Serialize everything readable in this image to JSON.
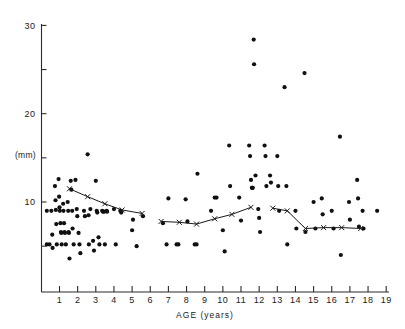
{
  "chart_data": {
    "type": "scatter",
    "title": "",
    "xlabel": "AGE (years)",
    "ylabel": "(mm)",
    "xlim": [
      0,
      19.4
    ],
    "ylim": [
      0,
      30.5
    ],
    "xticks": [
      1,
      2,
      3,
      4,
      5,
      6,
      7,
      8,
      9,
      10,
      11,
      12,
      13,
      14,
      15,
      16,
      17,
      18,
      19
    ],
    "xtick_labels": [
      "1",
      "2",
      "3",
      "4",
      "5",
      "6",
      "7",
      "8",
      "9",
      "10",
      "11",
      "12",
      "13",
      "14",
      "15",
      "16",
      "17",
      "18",
      "19"
    ],
    "yticks": [
      5,
      10,
      15,
      20,
      25,
      30
    ],
    "ytick_labels": [
      "",
      "10",
      "",
      "20",
      "",
      "30"
    ],
    "ytick_labeled": [
      10,
      20,
      30
    ],
    "grid": false,
    "legend": false,
    "series": [
      {
        "name": "individual measurements",
        "marker": "filled-circle",
        "color": "#101010",
        "points": [
          [
            0.3,
            9.0
          ],
          [
            0.3,
            5.2
          ],
          [
            0.45,
            5.2
          ],
          [
            0.55,
            9.0
          ],
          [
            0.6,
            6.3
          ],
          [
            0.62,
            4.8
          ],
          [
            0.75,
            11.8
          ],
          [
            0.78,
            10.2
          ],
          [
            0.8,
            9.1
          ],
          [
            0.82,
            7.5
          ],
          [
            0.85,
            5.2
          ],
          [
            0.95,
            12.6
          ],
          [
            0.98,
            10.6
          ],
          [
            1.0,
            9.4
          ],
          [
            1.02,
            9.0
          ],
          [
            1.05,
            7.6
          ],
          [
            1.08,
            6.6
          ],
          [
            1.1,
            6.5
          ],
          [
            1.12,
            5.2
          ],
          [
            1.2,
            9.8
          ],
          [
            1.22,
            9.0
          ],
          [
            1.25,
            7.6
          ],
          [
            1.28,
            6.6
          ],
          [
            1.3,
            6.5
          ],
          [
            1.35,
            5.2
          ],
          [
            1.45,
            10.0
          ],
          [
            1.48,
            9.0
          ],
          [
            1.5,
            6.6
          ],
          [
            1.52,
            6.5
          ],
          [
            1.55,
            3.6
          ],
          [
            1.62,
            12.4
          ],
          [
            1.65,
            11.4
          ],
          [
            1.7,
            9.0
          ],
          [
            1.72,
            7.0
          ],
          [
            1.78,
            5.2
          ],
          [
            1.88,
            12.5
          ],
          [
            1.95,
            9.2
          ],
          [
            1.98,
            8.4
          ],
          [
            2.05,
            6.5
          ],
          [
            2.1,
            5.2
          ],
          [
            2.15,
            4.2
          ],
          [
            2.35,
            9.0
          ],
          [
            2.4,
            8.4
          ],
          [
            2.55,
            15.4
          ],
          [
            2.6,
            8.5
          ],
          [
            2.62,
            5.2
          ],
          [
            2.7,
            9.2
          ],
          [
            2.85,
            5.6
          ],
          [
            2.9,
            4.5
          ],
          [
            3.0,
            12.4
          ],
          [
            3.05,
            9.0
          ],
          [
            3.08,
            8.8
          ],
          [
            3.15,
            6.0
          ],
          [
            3.2,
            5.2
          ],
          [
            3.35,
            9.0
          ],
          [
            3.4,
            8.9
          ],
          [
            3.45,
            8.9
          ],
          [
            3.5,
            5.2
          ],
          [
            3.6,
            9.0
          ],
          [
            3.62,
            8.9
          ],
          [
            4.0,
            9.2
          ],
          [
            4.1,
            5.2
          ],
          [
            4.35,
            9.0
          ],
          [
            4.4,
            8.8
          ],
          [
            5.0,
            6.8
          ],
          [
            5.05,
            8.0
          ],
          [
            5.25,
            5.0
          ],
          [
            5.6,
            8.4
          ],
          [
            6.7,
            7.6
          ],
          [
            6.9,
            5.2
          ],
          [
            7.0,
            10.4
          ],
          [
            7.45,
            5.2
          ],
          [
            7.55,
            5.2
          ],
          [
            7.95,
            10.3
          ],
          [
            8.05,
            7.8
          ],
          [
            8.45,
            5.2
          ],
          [
            8.55,
            5.2
          ],
          [
            8.6,
            13.2
          ],
          [
            9.35,
            9.0
          ],
          [
            9.55,
            10.5
          ],
          [
            9.65,
            10.5
          ],
          [
            10.0,
            6.8
          ],
          [
            10.1,
            4.4
          ],
          [
            10.35,
            16.4
          ],
          [
            10.4,
            11.8
          ],
          [
            10.9,
            10.5
          ],
          [
            11.0,
            7.9
          ],
          [
            11.45,
            16.4
          ],
          [
            11.5,
            15.2
          ],
          [
            11.55,
            12.5
          ],
          [
            11.6,
            11.6
          ],
          [
            11.62,
            11.6
          ],
          [
            11.65,
            11.6
          ],
          [
            11.7,
            28.4
          ],
          [
            11.72,
            25.6
          ],
          [
            11.8,
            13.0
          ],
          [
            11.95,
            9.2
          ],
          [
            12.0,
            8.2
          ],
          [
            12.05,
            6.6
          ],
          [
            12.3,
            16.4
          ],
          [
            12.35,
            15.2
          ],
          [
            12.4,
            11.8
          ],
          [
            12.6,
            13.0
          ],
          [
            12.65,
            12.2
          ],
          [
            13.0,
            15.2
          ],
          [
            13.05,
            11.8
          ],
          [
            13.1,
            9.0
          ],
          [
            13.4,
            23.0
          ],
          [
            13.5,
            11.8
          ],
          [
            13.55,
            5.2
          ],
          [
            14.0,
            9.0
          ],
          [
            14.05,
            7.0
          ],
          [
            14.5,
            24.6
          ],
          [
            14.55,
            6.6
          ],
          [
            15.0,
            10.0
          ],
          [
            15.1,
            7.0
          ],
          [
            15.45,
            10.4
          ],
          [
            15.5,
            8.6
          ],
          [
            16.0,
            9.0
          ],
          [
            16.1,
            7.0
          ],
          [
            16.45,
            17.4
          ],
          [
            16.5,
            4.0
          ],
          [
            16.95,
            10.0
          ],
          [
            17.0,
            8.0
          ],
          [
            17.4,
            12.5
          ],
          [
            17.45,
            10.4
          ],
          [
            17.5,
            7.2
          ],
          [
            17.7,
            9.0
          ],
          [
            17.75,
            7.0
          ],
          [
            18.5,
            9.0
          ]
        ]
      }
    ],
    "mean_curve": {
      "name": "mean",
      "marker": "x",
      "color": "#1a1a1a",
      "segments": [
        {
          "points": [
            [
              1.55,
              11.5
            ],
            [
              2.55,
              10.6
            ],
            [
              3.5,
              9.8
            ],
            [
              4.45,
              9.1
            ],
            [
              5.55,
              8.7
            ]
          ]
        },
        {
          "points": [
            [
              6.6,
              7.8
            ],
            [
              7.6,
              7.7
            ],
            [
              8.55,
              7.5
            ],
            [
              9.55,
              8.1
            ],
            [
              10.5,
              8.6
            ],
            [
              11.55,
              9.4
            ]
          ]
        },
        {
          "points": [
            [
              12.75,
              9.3
            ],
            [
              13.55,
              9.0
            ],
            [
              14.55,
              7.0
            ],
            [
              15.55,
              7.1
            ],
            [
              16.55,
              7.1
            ],
            [
              17.6,
              7.0
            ]
          ]
        }
      ]
    }
  },
  "axes": {
    "y_unit_label": "(mm)",
    "x_title": "AGE (years)"
  }
}
